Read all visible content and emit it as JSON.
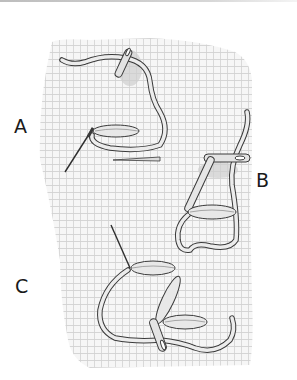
{
  "figure": {
    "labels": {
      "a": "A",
      "b": "B",
      "c": "C"
    },
    "colors": {
      "fabric_grid": "#c9c9c9",
      "fabric_bg": "#f3f3f3",
      "thread_outline": "#3a3a3a",
      "thread_fill": "#e6e6e6",
      "needle": "#2e2e2e",
      "shadow": "#cfcfcf",
      "label": "#1a1a1a"
    }
  }
}
